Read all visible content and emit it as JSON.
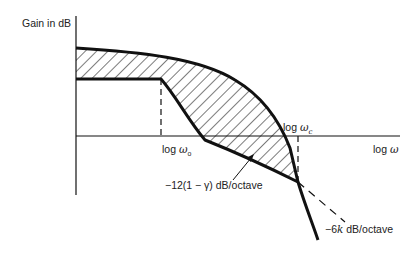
{
  "diagram": {
    "y_axis_label": "Gain in dB",
    "x_axis_label_prefix": "log ",
    "x_axis_label_symbol": "ω",
    "omega_o_prefix": "log ",
    "omega_o_symbol": "ω",
    "omega_o_sub": "o",
    "omega_c_prefix": "log ",
    "omega_c_symbol": "ω",
    "omega_c_sub": "c",
    "slope_label_mid": "−12(1 − γ) dB/octave",
    "slope_label_high_prefix": "−6",
    "slope_label_high_k": "k",
    "slope_label_high_suffix": " dB/octave",
    "colors": {
      "line": "#111111",
      "hatch": "#222222",
      "background": "#ffffff"
    }
  }
}
